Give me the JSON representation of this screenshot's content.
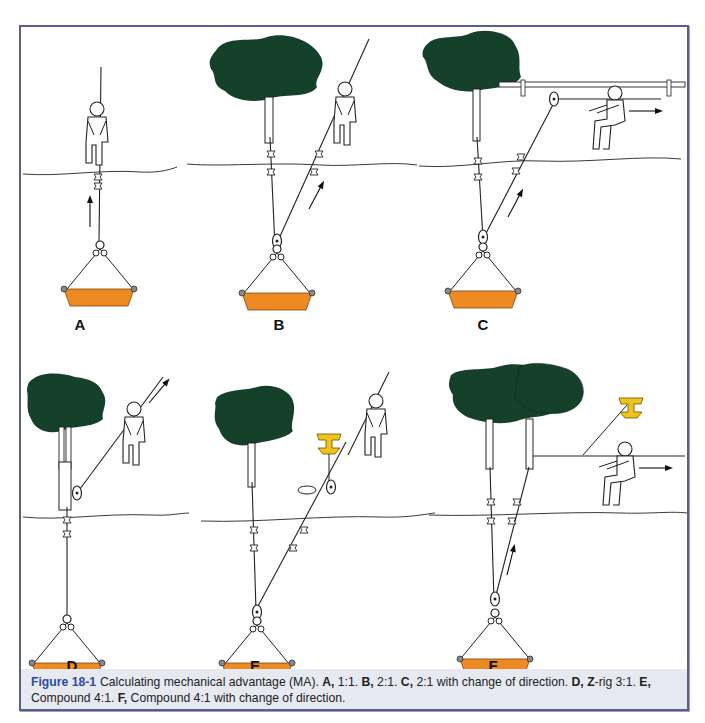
{
  "figure": {
    "number": "Figure 18-1",
    "caption_segments": [
      {
        "text": "Calculating mechanical advantage (MA). ",
        "bold": false
      },
      {
        "text": "A,",
        "bold": true
      },
      {
        "text": " 1:1. ",
        "bold": false
      },
      {
        "text": "B,",
        "bold": true
      },
      {
        "text": " 2:1. ",
        "bold": false
      },
      {
        "text": "C,",
        "bold": true
      },
      {
        "text": " 2:1 with change of direction. ",
        "bold": false
      },
      {
        "text": "D,",
        "bold": true
      },
      {
        "text": " ",
        "bold": false
      },
      {
        "text": "Z",
        "bold": true
      },
      {
        "text": "-rig 3:1. ",
        "bold": false
      },
      {
        "text": "E,",
        "bold": true
      },
      {
        "text": " Compound 4:1. ",
        "bold": false
      },
      {
        "text": "F,",
        "bold": true
      },
      {
        "text": " Compound 4:1 with change of direction.",
        "bold": false
      }
    ]
  },
  "panels": [
    {
      "id": "A",
      "label": "A",
      "description": "1:1"
    },
    {
      "id": "B",
      "label": "B",
      "description": "2:1"
    },
    {
      "id": "C",
      "label": "C",
      "description": "2:1 with change of direction"
    },
    {
      "id": "D",
      "label": "D",
      "description": "Z-rig 3:1"
    },
    {
      "id": "E",
      "label": "E",
      "description": "Compound 4:1"
    },
    {
      "id": "F",
      "label": "F",
      "description": "Compound 4:1 with change of direction"
    }
  ],
  "colors": {
    "frame": "#5a5f86",
    "caption_bg": "#e7e9f1",
    "figure_number": "#2c4aa6",
    "tree_canopy": "#15402a",
    "load_bucket": "#ee8a22",
    "anchor": "#f1c41c",
    "line": "#222222"
  }
}
